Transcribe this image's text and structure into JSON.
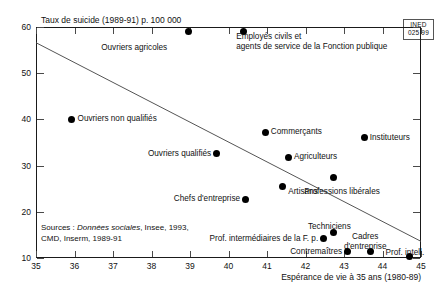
{
  "chart_data": {
    "type": "scatter",
    "title": "",
    "ylabel": "Taux de suicide (1989-91) p. 100 000",
    "xlabel": "Espérance de vie à 35 ans (1980-89)",
    "xlim": [
      35,
      45
    ],
    "ylim": [
      10,
      60
    ],
    "xticks": [
      "35",
      "36",
      "37",
      "38",
      "39",
      "40",
      "41",
      "42",
      "43",
      "44",
      "45"
    ],
    "yticks": [
      "10",
      "20",
      "30",
      "40",
      "50",
      "60"
    ],
    "grid": false,
    "legend": null,
    "points": [
      {
        "label": "Ouvriers agricoles",
        "x": 38.95,
        "y": 59.1,
        "lx": 37.55,
        "ly": 56.6,
        "anchor": "c"
      },
      {
        "label": "Employés civils et",
        "x": 40.4,
        "y": 59.1,
        "lx": 40.2,
        "ly": 56.8,
        "anchor": "r",
        "label2": "agents de service de la Fonction publique"
      },
      {
        "label": "Ouvriers non qualifiés",
        "x": 35.93,
        "y": 40.0,
        "lx": 36.08,
        "ly": 40.0,
        "anchor": "r"
      },
      {
        "label": "Commerçants",
        "x": 40.95,
        "y": 37.2,
        "lx": 41.1,
        "ly": 37.2,
        "anchor": "r"
      },
      {
        "label": "Instituteurs",
        "x": 43.52,
        "y": 36.0,
        "lx": 43.67,
        "ly": 36.0,
        "anchor": "r"
      },
      {
        "label": "Ouvriers qualifiés",
        "x": 39.7,
        "y": 32.6,
        "lx": 39.55,
        "ly": 32.6,
        "anchor": "l"
      },
      {
        "label": "Agriculteurs",
        "x": 41.55,
        "y": 31.8,
        "lx": 41.7,
        "ly": 31.8,
        "anchor": "r"
      },
      {
        "label": "Professions libérales",
        "x": 42.72,
        "y": 27.4,
        "lx": 42.95,
        "ly": 25.3,
        "anchor": "c"
      },
      {
        "label": "Artisans",
        "x": 41.4,
        "y": 25.4,
        "lx": 41.55,
        "ly": 24.3,
        "anchor": "r"
      },
      {
        "label": "Chefs d'entreprise",
        "x": 40.45,
        "y": 22.7,
        "lx": 40.3,
        "ly": 22.7,
        "anchor": "l"
      },
      {
        "label": "Techniciens",
        "x": 42.72,
        "y": 15.6,
        "lx": 42.62,
        "ly": 17.9,
        "anchor": "c"
      },
      {
        "label": "Prof. intermédiaires de la F. p.",
        "x": 42.48,
        "y": 14.2,
        "lx": 42.33,
        "ly": 14.2,
        "anchor": "l"
      },
      {
        "label": "Cadres",
        "x": 43.7,
        "y": 11.3,
        "lx": 43.55,
        "ly": 15.6,
        "anchor": "c",
        "label2": "d'entreprise"
      },
      {
        "label": "Contremaîtres",
        "x": 43.1,
        "y": 11.3,
        "lx": 42.95,
        "ly": 11.3,
        "anchor": "l"
      },
      {
        "label": "Prof. intell.",
        "x": 44.7,
        "y": 10.4,
        "lx": 44.58,
        "ly": 12.1,
        "anchor": "c"
      }
    ],
    "trend_line": {
      "x0": 35.0,
      "y0": 56.6,
      "x1": 45.0,
      "y1": 13.6
    }
  },
  "source_note": {
    "prefix": "Sources : ",
    "italic": "Données sociales",
    "suffix": ", Insee, 1993,",
    "line2": "CMD, Inserm, 1989-91"
  },
  "ined_stamp": {
    "name": "INED",
    "code": "025 99"
  }
}
